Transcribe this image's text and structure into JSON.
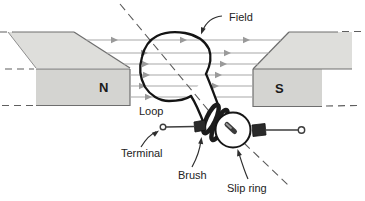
{
  "diagram": {
    "poles": {
      "left": "N",
      "right": "S"
    },
    "labels": {
      "field": "Field",
      "loop": "Loop",
      "terminal": "Terminal",
      "brush": "Brush",
      "slip_ring": "Slip ring"
    },
    "colors": {
      "background": "#ffffff",
      "magnet_top": "#dededb",
      "magnet_front": "#d4d4d1",
      "magnet_edge": "#6e6e6e",
      "field_line": "#a8a8a8",
      "ink": "#1a1a1a",
      "label_text": "#232323"
    }
  }
}
